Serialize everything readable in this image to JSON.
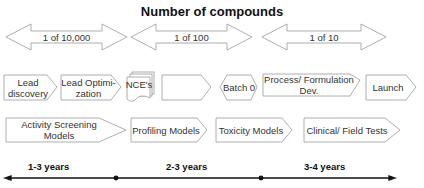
{
  "title": "Number of compounds",
  "ratios": [
    {
      "label": "1 of 10,000"
    },
    {
      "label": "1 of 100"
    },
    {
      "label": "1 of 10"
    }
  ],
  "stages": [
    {
      "label": "Lead discovery",
      "shape": "pentagon"
    },
    {
      "label": "Lead Optimi- zation",
      "shape": "pentagon"
    },
    {
      "label": "NCE's",
      "shape": "stacked-documents"
    },
    {
      "label": "",
      "shape": "pentagon"
    },
    {
      "label": "Batch 0",
      "shape": "hexagon"
    },
    {
      "label": "Process/ Formulation Dev.",
      "shape": "pentagon"
    },
    {
      "label": "Launch",
      "shape": "pentagon"
    }
  ],
  "models": [
    {
      "label": "Activity Screening Models"
    },
    {
      "label": "Profiling Models"
    },
    {
      "label": "Toxicity Models"
    },
    {
      "label": "Clinical/ Field Tests"
    }
  ],
  "timeline": [
    {
      "label": "1-3 years"
    },
    {
      "label": "2-3 years"
    },
    {
      "label": "3-4 years"
    }
  ],
  "colors": {
    "stroke": "#999999",
    "text": "#333333",
    "line": "#111111"
  }
}
